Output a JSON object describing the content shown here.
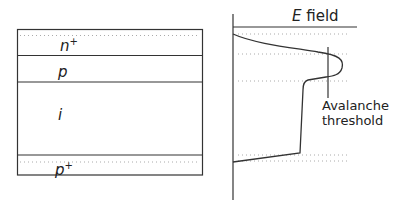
{
  "device": {
    "layers": [
      {
        "name": "n+",
        "base": "n",
        "sup": "+"
      },
      {
        "name": "p",
        "base": "p",
        "sup": ""
      },
      {
        "name": "i",
        "base": "i",
        "sup": ""
      },
      {
        "name": "p+",
        "base": "p",
        "sup": "+"
      }
    ]
  },
  "field_plot": {
    "title_var": "E",
    "title_rest": " field",
    "threshold_label_line1": "Avalanche",
    "threshold_label_line2": "threshold"
  },
  "colors": {
    "line": "#333333",
    "dotted": "#aaaaaa",
    "background": "#ffffff"
  }
}
